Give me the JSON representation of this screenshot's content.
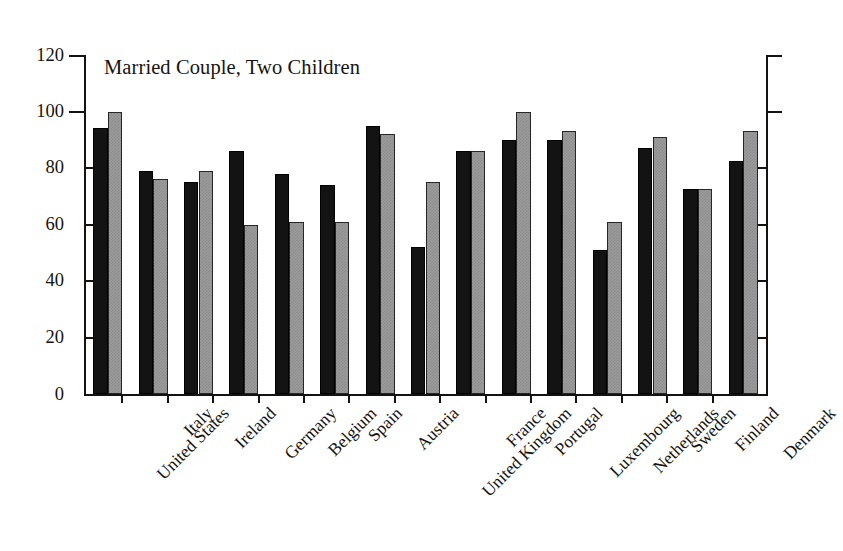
{
  "chart_data": {
    "type": "bar",
    "title": "Married Couple, Two Children",
    "xlabel": "",
    "ylabel": "",
    "ylim": [
      0,
      120
    ],
    "yticks": [
      0,
      20,
      40,
      60,
      80,
      100,
      120
    ],
    "grid": false,
    "legend": "none",
    "categories": [
      "United States",
      "Italy",
      "Ireland",
      "Germany",
      "Belgium",
      "Spain",
      "Austria",
      "United Kingdom",
      "France",
      "Portugal",
      "Luxembourg",
      "Netherlands",
      "Sweden",
      "Finland",
      "Denmark"
    ],
    "series": [
      {
        "name": "series-dark",
        "color": "#131313",
        "values": [
          94,
          79,
          75,
          86,
          78,
          74,
          95,
          52,
          86,
          90,
          90,
          51,
          87,
          72.5,
          82.5
        ]
      },
      {
        "name": "series-light",
        "color": "#9c9c9c",
        "values": [
          100,
          76,
          79,
          60,
          61,
          61,
          92,
          75,
          86,
          100,
          93,
          61,
          91,
          72.5,
          93
        ]
      }
    ]
  },
  "axis": {
    "y_tick_labels": [
      "120",
      "100",
      "80",
      "60",
      "40",
      "20",
      "0"
    ]
  }
}
